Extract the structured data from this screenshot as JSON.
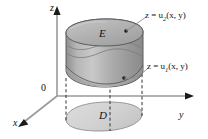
{
  "figure": {
    "background": "#ffffff",
    "width": 208,
    "height": 139
  },
  "axes": {
    "z_label": "z",
    "x_label": "x",
    "y_label": "y",
    "origin_label": "0",
    "axis_color": "#9a9a9a",
    "arrow_color": "#1a1a1a"
  },
  "regions": {
    "solid_label": "E",
    "plane_label": "D",
    "solid_fill": "#a9a9a9",
    "solid_top_fill": "#b4b4b4",
    "plane_fill": "#d6d6d6",
    "outline_color": "#4f4f4f"
  },
  "annotations": [
    {
      "id": "upper-surface",
      "text_prefix": "z = u",
      "subscript": "2",
      "text_suffix": "(x, y)",
      "full_text": "z = u2(x, y)"
    },
    {
      "id": "lower-surface",
      "text_prefix": "z = u",
      "subscript": "1",
      "text_suffix": "(x, y)",
      "full_text": "z = u1(x, y)"
    }
  ],
  "dashed_lines": {
    "color": "#333333",
    "count": 4
  }
}
